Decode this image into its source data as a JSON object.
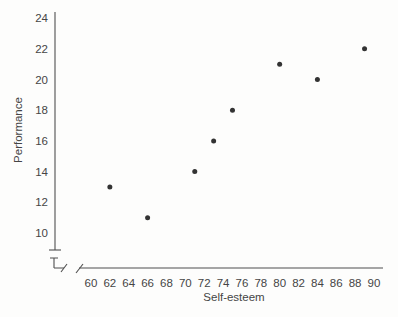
{
  "figure": {
    "background": "#fdfdfc",
    "line_color": "#4f4f4f",
    "text_color": "#454545",
    "marker_color": "#333333"
  },
  "chart_data": {
    "type": "scatter",
    "title": "",
    "xlabel": "Self-esteem",
    "ylabel": "Performance",
    "points": [
      {
        "x": 62,
        "y": 13
      },
      {
        "x": 66,
        "y": 11
      },
      {
        "x": 71,
        "y": 14
      },
      {
        "x": 73,
        "y": 16
      },
      {
        "x": 75,
        "y": 18
      },
      {
        "x": 80,
        "y": 21
      },
      {
        "x": 84,
        "y": 20
      },
      {
        "x": 89,
        "y": 22
      }
    ],
    "x_ticks": [
      60,
      62,
      64,
      66,
      68,
      70,
      72,
      74,
      76,
      78,
      80,
      82,
      84,
      86,
      88,
      90
    ],
    "y_ticks": [
      10,
      12,
      14,
      16,
      18,
      20,
      22,
      24
    ],
    "xlim": [
      60,
      90
    ],
    "ylim": [
      10,
      24
    ],
    "axis_break_x": true,
    "axis_break_y": true,
    "grid": false,
    "legend": "none",
    "marker_style": "filled-circle"
  }
}
